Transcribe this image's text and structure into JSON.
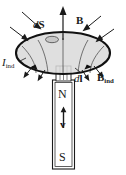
{
  "figure": {
    "width": 126,
    "height": 175,
    "background": "#ffffff",
    "ink_color": "#1a1a1a",
    "loop_fill": "#d9d9d9",
    "magnet_fill": "#ffffff"
  },
  "labels": {
    "area_element": {
      "d": "d",
      "symbol": "S"
    },
    "field": {
      "symbol": "B"
    },
    "induced_current": {
      "symbol": "I",
      "subscript": "ind"
    },
    "length_element": {
      "d": "d",
      "symbol": "l"
    },
    "induced_field": {
      "symbol": "B",
      "subscript": "ind"
    },
    "north_pole": "N",
    "south_pole": "S",
    "velocity": "v"
  },
  "magnet": {
    "north_label": "N",
    "south_label": "S",
    "velocity_label": "v",
    "velocity_direction": "up"
  },
  "loop": {
    "shape": "ellipse",
    "current_direction": "counterclockwise-viewed-from-above",
    "shaded": true
  },
  "field_arrows": {
    "outward_upper_count": 4,
    "outward_lower_count": 4,
    "flux_line_count": 5,
    "axis_arrow": "up"
  }
}
